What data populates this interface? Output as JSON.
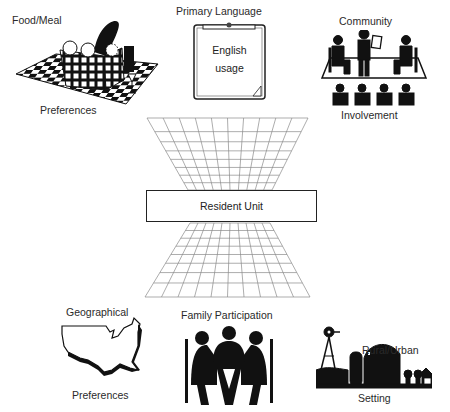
{
  "center": {
    "label": "Resident Unit"
  },
  "nodes": [
    {
      "id": "food",
      "title": "Food/Meal",
      "subtitle": "Preferences",
      "icon": "picnic-basket-icon"
    },
    {
      "id": "language",
      "title": "Primary Language",
      "clipboard_lines": [
        "English",
        "usage"
      ],
      "icon": "clipboard-icon"
    },
    {
      "id": "community",
      "title": "Community",
      "subtitle": "Involvement",
      "icon": "meeting-stage-icon"
    },
    {
      "id": "geo",
      "title": "Geographical",
      "subtitle": "Preferences",
      "icon": "usa-map-icon"
    },
    {
      "id": "family",
      "title": "Family Participation",
      "icon": "family-table-icon"
    },
    {
      "id": "rural",
      "title": "Rural/Urban",
      "subtitle": "Setting",
      "icon": "farm-windmill-icon"
    }
  ],
  "colors": {
    "ink": "#1a1a1a",
    "grid": "#888888",
    "background": "#ffffff"
  }
}
